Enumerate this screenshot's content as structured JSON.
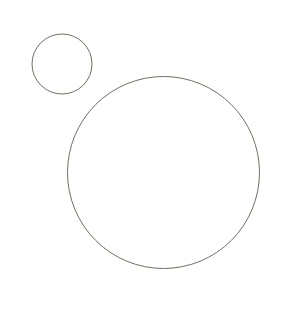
{
  "canvas": {
    "width": 292,
    "height": 320,
    "background_color": "#ffffff",
    "has_border": false,
    "title": "Two Circles"
  },
  "style": {
    "stroke_color": "#6f6f62",
    "stroke_width": 1,
    "fill_color": "none"
  },
  "shapes": [
    {
      "name": "small-circle",
      "type": "circle",
      "center_x": 62,
      "center_y": 64,
      "radius": 30,
      "diameter": 60,
      "stroke_color": "#6f6f62",
      "stroke_width": 1,
      "fill_color": "none",
      "bounds": {
        "left": 32,
        "top": 34,
        "right": 92,
        "bottom": 94
      }
    },
    {
      "name": "large-circle",
      "type": "circle",
      "center_x": 163.5,
      "center_y": 172.5,
      "radius": 96,
      "diameter": 192,
      "stroke_color": "#6f6f62",
      "stroke_width": 1,
      "fill_color": "none",
      "bounds": {
        "left": 67.5,
        "top": 76.5,
        "right": 259.5,
        "bottom": 268.5
      }
    }
  ],
  "chart_data": {
    "type": "scatter",
    "title": "",
    "xlabel": "",
    "ylabel": "",
    "grid": false,
    "legend": "none",
    "xlim": [
      0,
      292
    ],
    "ylim": [
      0,
      320
    ],
    "series": [
      {
        "name": "circles",
        "values": [
          {
            "label": "small-circle",
            "x": 62,
            "y": 64,
            "r": 30
          },
          {
            "label": "large-circle",
            "x": 163.5,
            "y": 172.5,
            "r": 96
          }
        ]
      }
    ]
  }
}
